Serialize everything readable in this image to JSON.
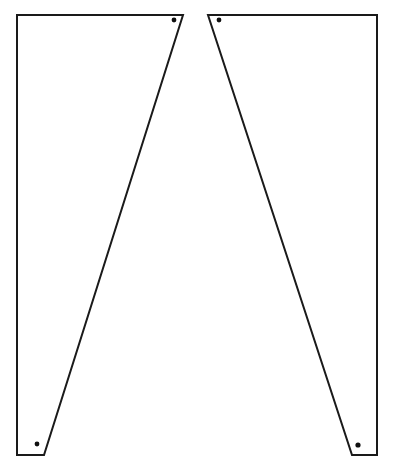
{
  "document": {
    "title": "Two-panel mirrored trapezoid template",
    "background_color": "#ffffff",
    "stroke_color": "#1a1a1a",
    "hole_color": "#101010",
    "stroke_width": 2,
    "canvas": {
      "width": 397,
      "height": 475
    }
  },
  "chart_data": {
    "type": "diagram",
    "xlabel": "",
    "ylabel": "",
    "xlim": [
      0,
      397
    ],
    "ylim": [
      0,
      475
    ],
    "grid": false,
    "legend": "none",
    "shapes": [
      {
        "name": "left-panel",
        "kind": "polygon",
        "points": "17,15 183,15 44,455 17,455",
        "vertices": [
          [
            17,
            15
          ],
          [
            183,
            15
          ],
          [
            44,
            455
          ],
          [
            17,
            455
          ]
        ],
        "fill": "#ffffff",
        "stroke": "#1a1a1a"
      },
      {
        "name": "right-panel",
        "kind": "polygon",
        "points": "208,15 377,15 377,455 352,455",
        "vertices": [
          [
            208,
            15
          ],
          [
            377,
            15
          ],
          [
            377,
            455
          ],
          [
            352,
            455
          ]
        ],
        "fill": "#ffffff",
        "stroke": "#1a1a1a"
      }
    ],
    "markers": [
      {
        "name": "left-panel-top-hole",
        "cx": 174,
        "cy": 20,
        "r": 2.4,
        "fill": "#101010"
      },
      {
        "name": "left-panel-bottom-hole",
        "cx": 37,
        "cy": 444,
        "r": 2.4,
        "fill": "#101010"
      },
      {
        "name": "right-panel-top-hole",
        "cx": 219,
        "cy": 20,
        "r": 2.4,
        "fill": "#101010"
      },
      {
        "name": "right-panel-bottom-hole",
        "cx": 358,
        "cy": 445,
        "r": 2.6,
        "fill": "#101010"
      }
    ]
  }
}
